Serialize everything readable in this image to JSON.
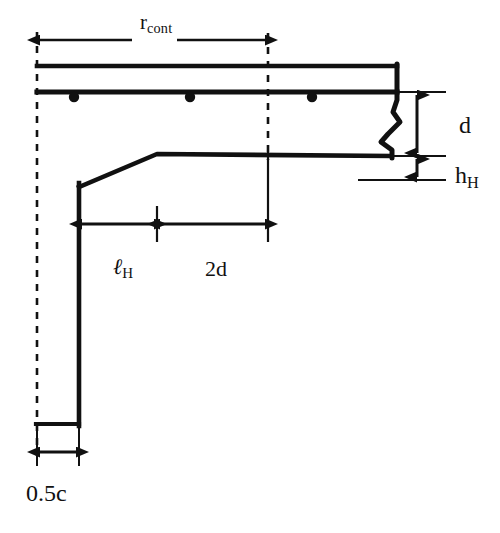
{
  "figure": {
    "background_color": "#ffffff",
    "line_color": "#111111"
  },
  "labels": {
    "r_cont": {
      "text": "r",
      "sub": "cont"
    },
    "d": {
      "text": "d"
    },
    "h_H": {
      "text": "h",
      "sub": "H"
    },
    "l_H": {
      "text": "ℓ",
      "sub": "H"
    },
    "two_d": {
      "text": "2d"
    },
    "half_c": {
      "text": "0.5c"
    }
  },
  "geometry": {
    "units": "px",
    "centerline_left_x": 37,
    "centerline_right_x": 268,
    "slab_top_y": 66,
    "slab_bottom_y": 92,
    "slab_right_x": 397,
    "drop_panel_bottom_y": 156,
    "drop_panel_left_x": 79,
    "drop_panel_slope_top_x": 157,
    "drop_panel_slope_bottom_y": 187,
    "column_right_x": 79,
    "column_bottom_y": 424,
    "column_base_left_x": 37,
    "ref_line_top_y": 92,
    "ref_line_bottom_y": 180,
    "rebar_dot_y": 97,
    "rebar_dot_xs": [
      74,
      190,
      312
    ],
    "rebar_dot_radius": 5
  },
  "dimensions": [
    {
      "name": "r_cont",
      "orientation": "horizontal",
      "from_x": 37,
      "to_x": 268,
      "y": 40,
      "style": "double-arrow-broken"
    },
    {
      "name": "d",
      "orientation": "vertical",
      "from_y": 92,
      "to_y": 156,
      "x": 417,
      "style": "double-arrow"
    },
    {
      "name": "h_H",
      "orientation": "vertical",
      "from_y": 156,
      "to_y": 180,
      "x": 417,
      "style": "double-arrow"
    },
    {
      "name": "l_H",
      "orientation": "horizontal",
      "from_x": 79,
      "to_x": 157,
      "y": 224,
      "style": "double-arrow"
    },
    {
      "name": "2d",
      "orientation": "horizontal",
      "from_x": 157,
      "to_x": 268,
      "y": 224,
      "style": "double-arrow"
    },
    {
      "name": "0.5c",
      "orientation": "horizontal",
      "from_x": 37,
      "to_x": 79,
      "y": 452,
      "style": "double-arrow"
    }
  ]
}
